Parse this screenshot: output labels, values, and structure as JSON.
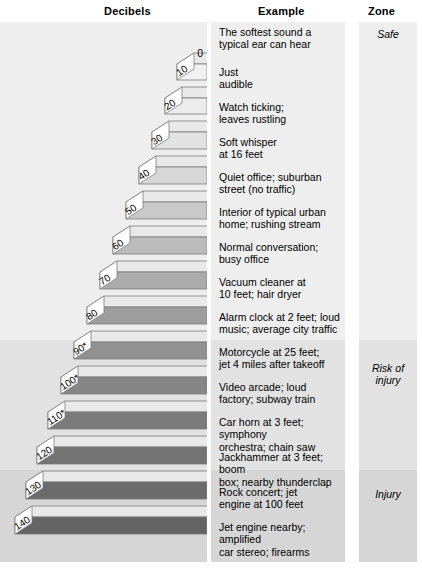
{
  "headers": {
    "decibels": "Decibels",
    "example": "Example",
    "zone": "Zone"
  },
  "zero_label": "0",
  "footnote": "",
  "colors": {
    "band_safe": "#eeeeee",
    "band_risk": "#e2e2e2",
    "band_injury": "#d6d6d6",
    "bar_outline": "#7c7c7c",
    "text": "#000000"
  },
  "zones": [
    {
      "label": "Safe",
      "top": 0,
      "height": 318
    },
    {
      "label": "Risk of\ninjury",
      "top": 318,
      "height": 130
    },
    {
      "label": "Injury",
      "top": 448,
      "height": 222
    }
  ],
  "zone_labels": [
    {
      "name": "zone-safe",
      "text": "Safe",
      "top": 6
    },
    {
      "name": "zone-risk",
      "text": "Risk of injury",
      "top": 340
    },
    {
      "name": "zone-injury",
      "text": "Injury",
      "top": 466
    }
  ],
  "chart_data": {
    "type": "bar",
    "title": "Decibels",
    "xlabel": "Decibels",
    "ylabel": "",
    "categories": [
      "0",
      "10",
      "20",
      "30",
      "40",
      "50",
      "60",
      "70",
      "80",
      "90*",
      "100*",
      "110*",
      "120",
      "130",
      "140"
    ],
    "values": [
      0,
      10,
      20,
      30,
      40,
      50,
      60,
      70,
      80,
      90,
      100,
      110,
      120,
      130,
      140
    ],
    "xlim": [
      0,
      140
    ],
    "grid": false,
    "legend": null,
    "orientation": "horizontal-right-anchored-isometric"
  },
  "rows": [
    {
      "db": "0",
      "db_display": "0",
      "example": "The softest sound a typical ear can hear",
      "zone": "Safe",
      "bar": null
    },
    {
      "db": "10",
      "db_display": "10",
      "example": "Just audible",
      "zone": "Safe",
      "bar": {
        "top": 42,
        "width": 30,
        "height": 16,
        "fill": "#f2f2f2"
      }
    },
    {
      "db": "20",
      "db_display": "20",
      "example": "Watch ticking; leaves rustling",
      "zone": "Safe",
      "bar": {
        "top": 76,
        "width": 42,
        "height": 16,
        "fill": "#ececec"
      }
    },
    {
      "db": "30",
      "db_display": "30",
      "example": "Soft whisper at 16 feet",
      "zone": "Safe",
      "bar": {
        "top": 110,
        "width": 55,
        "height": 17,
        "fill": "#e2e2e2"
      }
    },
    {
      "db": "40",
      "db_display": "40",
      "example": "Quiet office; suburban street (no traffic)",
      "zone": "Safe",
      "bar": {
        "top": 145,
        "width": 68,
        "height": 17,
        "fill": "#d7d7d7"
      }
    },
    {
      "db": "50",
      "db_display": "50",
      "example": "Interior of typical urban home; rushing stream",
      "zone": "Safe",
      "bar": {
        "top": 180,
        "width": 81,
        "height": 17,
        "fill": "#c9c9c9"
      }
    },
    {
      "db": "60",
      "db_display": "60",
      "example": "Normal conversation; busy office",
      "zone": "Safe",
      "bar": {
        "top": 215,
        "width": 94,
        "height": 17,
        "fill": "#bcbcbc"
      }
    },
    {
      "db": "70",
      "db_display": "70",
      "example": "Vacuum cleaner at 10 feet; hair dryer",
      "zone": "Safe",
      "bar": {
        "top": 250,
        "width": 107,
        "height": 17,
        "fill": "#ababab"
      }
    },
    {
      "db": "80",
      "db_display": "80",
      "example": "Alarm clock at 2 feet; loud music; average city traffic",
      "zone": "Safe",
      "bar": {
        "top": 285,
        "width": 120,
        "height": 17,
        "fill": "#9d9d9d"
      }
    },
    {
      "db": "90*",
      "db_display": "90*",
      "example": "Motorcycle at 25 feet; jet 4 miles after takeoff",
      "zone": "Risk of injury",
      "bar": {
        "top": 320,
        "width": 133,
        "height": 17,
        "fill": "#919191"
      }
    },
    {
      "db": "100*",
      "db_display": "100*",
      "example": "Video arcade; loud factory; subway train",
      "zone": "Risk of injury",
      "bar": {
        "top": 355,
        "width": 146,
        "height": 17,
        "fill": "#868686"
      }
    },
    {
      "db": "110*",
      "db_display": "110*",
      "example": "Car horn at 3 feet; symphony orchestra; chain saw",
      "zone": "Risk of injury",
      "bar": {
        "top": 390,
        "width": 159,
        "height": 17,
        "fill": "#7b7b7b"
      }
    },
    {
      "db": "120",
      "db_display": "120",
      "example": "Jackhammer at 3 feet; boom box; nearby thunderclap",
      "zone": "Injury",
      "bar": {
        "top": 425,
        "width": 170,
        "height": 17,
        "fill": "#737373"
      }
    },
    {
      "db": "130",
      "db_display": "130",
      "example": "Rock concert; jet engine at 100 feet",
      "zone": "Injury",
      "bar": {
        "top": 460,
        "width": 181,
        "height": 17,
        "fill": "#6b6b6b"
      }
    },
    {
      "db": "140",
      "db_display": "140",
      "example": "Jet engine nearby; amplified car stereo; firearms",
      "zone": "Injury",
      "bar": {
        "top": 495,
        "width": 192,
        "height": 17,
        "fill": "#646464"
      }
    }
  ],
  "example_texts": [
    {
      "top": 4,
      "line1": "The softest sound a",
      "line2": "typical ear can hear"
    },
    {
      "top": 44,
      "line1": "Just",
      "line2": "audible"
    },
    {
      "top": 79,
      "line1": "Watch ticking;",
      "line2": "leaves rustling"
    },
    {
      "top": 114,
      "line1": "Soft whisper",
      "line2": "at 16 feet"
    },
    {
      "top": 149,
      "line1": "Quiet office; suburban",
      "line2": "street (no traffic)"
    },
    {
      "top": 184,
      "line1": "Interior of typical urban",
      "line2": "home; rushing stream"
    },
    {
      "top": 219,
      "line1": "Normal conversation;",
      "line2": "busy office"
    },
    {
      "top": 254,
      "line1": "Vacuum cleaner at",
      "line2": "10 feet; hair dryer"
    },
    {
      "top": 289,
      "line1": "Alarm clock at 2 feet; loud",
      "line2": "music; average city traffic"
    },
    {
      "top": 324,
      "line1": "Motorcycle at 25 feet;",
      "line2": "jet 4 miles after takeoff"
    },
    {
      "top": 359,
      "line1": "Video arcade; loud",
      "line2": "factory; subway train"
    },
    {
      "top": 394,
      "line1": "Car horn at 3 feet; symphony",
      "line2": "orchestra; chain saw"
    },
    {
      "top": 429,
      "line1": "Jackhammer at 3 feet; boom",
      "line2": "box; nearby thunderclap"
    },
    {
      "top": 464,
      "line1": "Rock concert; jet",
      "line2": "engine at 100 feet"
    },
    {
      "top": 499,
      "line1": "Jet engine nearby; amplified",
      "line2": "car stereo; firearms"
    }
  ]
}
